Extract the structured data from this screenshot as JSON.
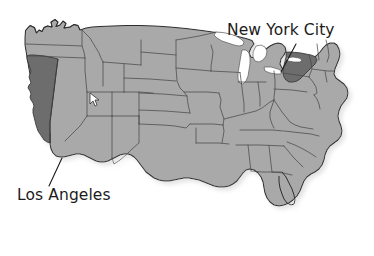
{
  "figure": {
    "type": "map",
    "background_color": "#ffffff",
    "width": 374,
    "height": 256
  },
  "map": {
    "base_state_fill": "#a9a9a9",
    "highlight_state_fill": "#6d6d6d",
    "border_color": "#4a4a4a",
    "outline_color": "#2e2e2e",
    "lake_fill": "#ffffff",
    "shadow_color": "#c9c9c9",
    "highlighted_states": [
      "California",
      "New York"
    ]
  },
  "annotations": [
    {
      "id": "new-york-city",
      "label": "New York City",
      "position": "top-right",
      "leader_line": true
    },
    {
      "id": "los-angeles",
      "label": "Los Angeles",
      "position": "bottom-left",
      "leader_line": true
    }
  ],
  "cursor_marker": {
    "name": "pointer-marker",
    "fill": "#ffffff",
    "stroke": "#333333"
  }
}
